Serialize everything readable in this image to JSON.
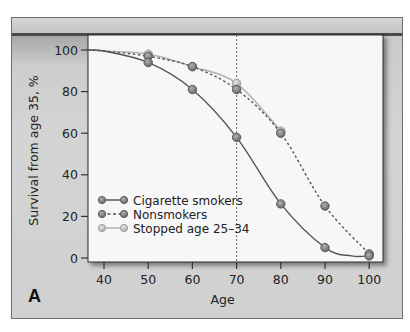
{
  "panel_label": "A",
  "chart_data": {
    "type": "line",
    "title": "",
    "xlabel": "Age",
    "ylabel": "Survival from age 35, %",
    "xlim": [
      36,
      103
    ],
    "ylim": [
      0,
      100
    ],
    "x_ticks": [
      40,
      50,
      60,
      70,
      80,
      90,
      100
    ],
    "y_ticks": [
      0,
      20,
      40,
      60,
      80,
      100
    ],
    "grid": false,
    "reference_line": {
      "x": 70,
      "style": "dotted"
    },
    "legend_position": "lower-left inside plot",
    "series": [
      {
        "name": "Cigarette smokers",
        "style": "solid",
        "color": "#555555",
        "marker_color": "#8a8a8a",
        "x": [
          50,
          60,
          70,
          80,
          90,
          100
        ],
        "values": [
          94,
          81,
          58,
          26,
          5,
          1
        ],
        "curve_start": {
          "x": 35,
          "y": 100
        }
      },
      {
        "name": "Nonsmokers",
        "style": "dashed",
        "color": "#555555",
        "marker_color": "#8a8a8a",
        "x": [
          50,
          60,
          70,
          80,
          90,
          100
        ],
        "values": [
          97,
          92,
          81,
          60,
          25,
          2
        ],
        "curve_start": {
          "x": 35,
          "y": 100
        }
      },
      {
        "name": "Stopped age 25–34",
        "style": "solid",
        "color": "#b5b5b5",
        "marker_color": "#c4c4c4",
        "x": [
          50,
          60,
          70,
          80
        ],
        "values": [
          98,
          92,
          84,
          61
        ],
        "curve_start": {
          "x": 35,
          "y": 100
        }
      }
    ]
  },
  "colors": {
    "frame_bg": "#d0d0d0",
    "plot_bg": "#f7f7f7",
    "axis": "#333333",
    "text": "#222222"
  }
}
